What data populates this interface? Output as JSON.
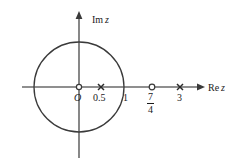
{
  "figure": {
    "width": 238,
    "height": 168,
    "background_color": "#ffffff",
    "stroke_color": "#3a3a3a",
    "axis_color": "#6a6a6a",
    "text_color": "#1a1a1a"
  },
  "axes": {
    "imaginary": {
      "label": "Im",
      "variable": "z",
      "full_label": "Im z",
      "orientation": "vertical",
      "arrow": "up",
      "x_px": 79,
      "y_top_px": 14,
      "y_bottom_px": 158
    },
    "real": {
      "label": "Re",
      "variable": "z",
      "full_label": "Re z",
      "orientation": "horizontal",
      "arrow": "right",
      "y_px": 87,
      "x_left_px": 22,
      "x_right_px": 200
    }
  },
  "circle": {
    "name": "unit-circle",
    "center_x": 0,
    "center_y": 0,
    "radius": 1,
    "center_x_px": 79,
    "center_y_px": 87,
    "radius_px": 45,
    "stroke_color": "#3a3a3a"
  },
  "scale": {
    "pixels_per_unit": 45,
    "origin_x_px": 79,
    "origin_y_px": 87
  },
  "origin": {
    "label": "O",
    "marker": "open-circle",
    "value": 0,
    "x_px": 79,
    "y_px": 87
  },
  "points": [
    {
      "id": "point-zero-point-five",
      "label": "0.5",
      "marker": "cross",
      "marker_name": "cross-marker",
      "value": 0.5,
      "x_px": 101,
      "y_px": 87,
      "label_x_px": 93,
      "label_y_px": 93
    },
    {
      "id": "point-one",
      "label": "1",
      "marker": "none",
      "marker_name": "no-marker",
      "value": 1,
      "x_px": 124,
      "y_px": 87,
      "label_x_px": 122,
      "label_y_px": 93
    },
    {
      "id": "point-seven-fourths",
      "label": "7/4",
      "numerator": "7",
      "denominator": "4",
      "marker": "open-circle",
      "marker_name": "open-circle-marker",
      "value": 1.75,
      "x_px": 152,
      "y_px": 87,
      "label_x_px": 148,
      "label_y_px": 93
    },
    {
      "id": "point-three",
      "label": "3",
      "marker": "cross",
      "marker_name": "cross-marker",
      "value": 3,
      "x_px": 180,
      "y_px": 87,
      "label_x_px": 177,
      "label_y_px": 93
    }
  ]
}
